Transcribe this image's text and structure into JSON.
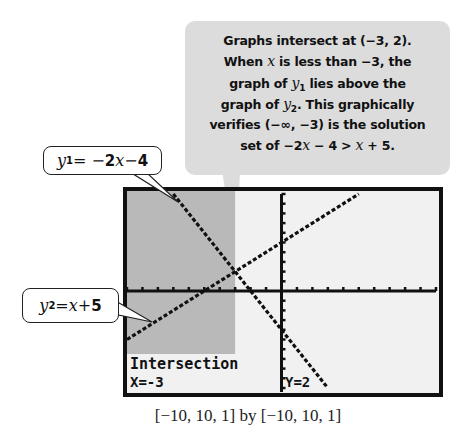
{
  "callout": {
    "lines": [
      {
        "pre": "Graphs intersect at (−3, 2).",
        "var": "",
        "sub": "",
        "post": ""
      },
      {
        "pre": "When ",
        "var": "x",
        "sub": "",
        "post": " is less than −3, the"
      },
      {
        "pre": "graph of ",
        "var": "y",
        "sub": "1",
        "post": " lies above the"
      },
      {
        "pre": "graph of ",
        "var": "y",
        "sub": "2",
        "post": ". This graphically"
      },
      {
        "pre": "verifies (−∞, −3) is the solution",
        "var": "",
        "sub": "",
        "post": ""
      },
      {
        "pre": "set of −2",
        "var": "x",
        "sub": "",
        "post": " − 4 > ",
        "var2": "x",
        "post2": " + 5."
      }
    ]
  },
  "equations": {
    "y1": {
      "var": "y",
      "sub": "1",
      "rhs_pre": " = −",
      "coef": "2",
      "x": "x",
      "rhs_post": " − ",
      "const": "4"
    },
    "y2": {
      "var": "y",
      "sub": "2",
      "rhs_pre": " = ",
      "x": "x",
      "rhs_post": " + ",
      "const": "5"
    }
  },
  "screen": {
    "trace_label": "Intersection",
    "x_readout": "X=-3",
    "y_readout": "Y=2"
  },
  "caption": "[−10, 10, 1] by [−10, 10, 1]",
  "colors": {
    "shade": "#b9b9b9",
    "screen_bg": "#f1f1f1",
    "callout_bg": "#dcdcdc",
    "ink": "#111111"
  },
  "chart_data": {
    "type": "line",
    "title": "",
    "xlabel": "",
    "ylabel": "",
    "xlim": [
      -10,
      10
    ],
    "ylim": [
      -10,
      10
    ],
    "xscale": 1,
    "yscale": 1,
    "grid": false,
    "series": [
      {
        "name": "y1 = -2x - 4",
        "slope": -2,
        "intercept": -4
      },
      {
        "name": "y2 = x + 5",
        "slope": 1,
        "intercept": 5
      }
    ],
    "intersection": {
      "x": -3,
      "y": 2
    },
    "shaded_region": {
      "x_from": -10,
      "x_to": -3,
      "label": "solution set (-∞, -3)"
    },
    "annotations": [
      "Intersection",
      "X=-3",
      "Y=2"
    ]
  }
}
